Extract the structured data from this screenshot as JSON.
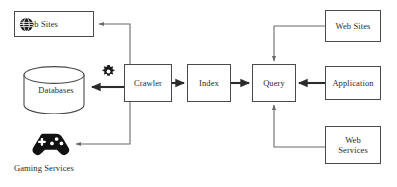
{
  "diagram": {
    "canvas": {
      "width": 397,
      "height": 187
    },
    "colors": {
      "node_border": "#4a4a4a",
      "node_fill": "#ffffff",
      "edge": "#6b6b6b",
      "edge_bold": "#2b2b2b",
      "text": "#2b2b2b",
      "icon": "#1a1a1a",
      "background": "#ffffff"
    },
    "nodes": {
      "websites_left": {
        "label": "Web Sites",
        "icon": "globe-icon",
        "shape": "rectangle"
      },
      "databases": {
        "label": "Databases",
        "shape": "cylinder"
      },
      "gaming": {
        "label": "Gaming Services",
        "icon": "gamepad-icon",
        "shape": "icon"
      },
      "crawler": {
        "label": "Crawler",
        "shape": "rectangle"
      },
      "index": {
        "label": "Index",
        "shape": "rectangle"
      },
      "query": {
        "label": "Query",
        "shape": "rectangle"
      },
      "websites_right": {
        "label": "Web Sites",
        "shape": "rectangle"
      },
      "application": {
        "label": "Application",
        "shape": "rectangle"
      },
      "webservices": {
        "label": "Web\nServices",
        "shape": "rectangle"
      },
      "gear": {
        "label": "",
        "icon": "gear-icon",
        "shape": "icon"
      }
    },
    "edges": [
      {
        "from": "crawler",
        "to": "websites_left",
        "style": "orthogonal",
        "direction": "left-up"
      },
      {
        "from": "crawler",
        "to": "databases",
        "style": "straight",
        "direction": "left"
      },
      {
        "from": "crawler",
        "to": "gaming",
        "style": "orthogonal",
        "direction": "left-down"
      },
      {
        "from": "crawler",
        "to": "index",
        "style": "straight",
        "direction": "right"
      },
      {
        "from": "index",
        "to": "query",
        "style": "straight",
        "direction": "right"
      },
      {
        "from": "websites_right",
        "to": "query",
        "style": "orthogonal",
        "direction": "left-down"
      },
      {
        "from": "application",
        "to": "query",
        "style": "straight",
        "direction": "left"
      },
      {
        "from": "webservices",
        "to": "query",
        "style": "orthogonal",
        "direction": "left-up"
      }
    ]
  }
}
